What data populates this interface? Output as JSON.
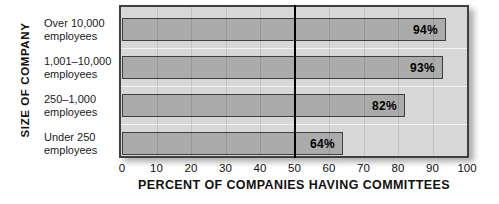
{
  "chart_data": {
    "type": "bar",
    "orientation": "horizontal",
    "title": "",
    "xlabel": "PERCENT OF COMPANIES HAVING COMMITTEES",
    "ylabel": "SIZE OF COMPANY",
    "categories": [
      [
        "Over 10,000",
        "employees"
      ],
      [
        "1,001–10,000",
        "employees"
      ],
      [
        "250–1,000",
        "employees"
      ],
      [
        "Under 250",
        "employees"
      ]
    ],
    "values": [
      94,
      93,
      82,
      64
    ],
    "value_labels": [
      "94%",
      "93%",
      "82%",
      "64%"
    ],
    "xlim": [
      0,
      100
    ],
    "xticks": [
      0,
      10,
      20,
      30,
      40,
      50,
      60,
      70,
      80,
      90,
      100
    ],
    "xtick_labels": [
      "0",
      "10",
      "20",
      "30",
      "40",
      "50",
      "60",
      "70",
      "80",
      "90",
      "100"
    ],
    "reference_line_x": 50,
    "grid": "vertical",
    "legend": "none",
    "colors": {
      "plot_background": "#d7d7d7",
      "bar_fill": "#ababab",
      "bar_border": "#3f3f3f",
      "frame_border": "#3f3f3f",
      "reference_line": "#000000",
      "text": "#111111",
      "page_background": "#ffffff"
    }
  }
}
